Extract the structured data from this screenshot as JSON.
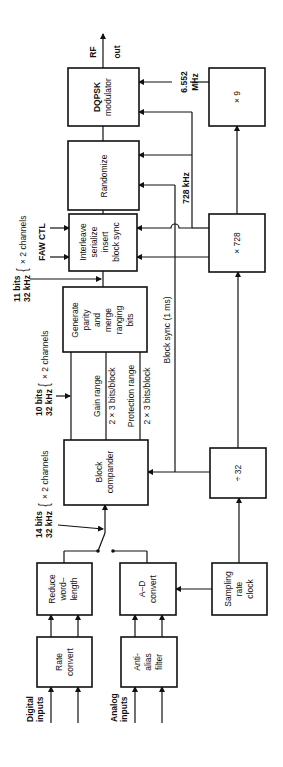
{
  "diagram": {
    "title": "",
    "orientation": "rotated-90-ccw",
    "blocks": [
      {
        "id": "dqpsk",
        "lines": [
          "DQPSK",
          "modulator"
        ]
      },
      {
        "id": "randomize",
        "lines": [
          "Randomize"
        ]
      },
      {
        "id": "interleave",
        "lines": [
          "Interleave",
          "serialize",
          "insert",
          "block sync"
        ]
      },
      {
        "id": "parity",
        "lines": [
          "Generate",
          "parity",
          "and",
          "merge",
          "ranging",
          "bits"
        ]
      },
      {
        "id": "compander",
        "lines": [
          "Block",
          "compander"
        ]
      },
      {
        "id": "x9",
        "lines": [
          "× 9"
        ]
      },
      {
        "id": "x728",
        "lines": [
          "× 728"
        ]
      },
      {
        "id": "div32",
        "lines": [
          "÷ 32"
        ]
      },
      {
        "id": "reduce",
        "lines": [
          "Reduce",
          "word–",
          "length"
        ]
      },
      {
        "id": "adconv",
        "lines": [
          "A–D",
          "convert"
        ]
      },
      {
        "id": "sampling",
        "lines": [
          "Sampling",
          "rate",
          "clock"
        ]
      },
      {
        "id": "rate",
        "lines": [
          "Rate",
          "convert"
        ]
      },
      {
        "id": "antialias",
        "lines": [
          "Anti-",
          "alias",
          "filter"
        ]
      }
    ],
    "labels": {
      "rf_out_1": "RF",
      "rf_out_2": "out",
      "mhz_1": "6.552",
      "mhz_2": "MHz",
      "khz728": "728 kHz",
      "bits11_1": "11 bits",
      "bits11_2": "32 kHz",
      "bits11_ch": "× 2 channels",
      "faw_ctl": "FAW  CTL",
      "bits10_1": "10 bits",
      "bits10_2": "32 kHz",
      "bits10_ch": "× 2 channels",
      "gain_range": "Gain range",
      "gain_bits": "2 × 3 bits/block",
      "prot_range": "Protection range",
      "prot_bits": "2 × 3 bits/block",
      "block_sync": "Block sync (1 ms)",
      "bits14_1": "14 bits",
      "bits14_2": "32 kHz",
      "bits14_ch": "× 2 channels",
      "digital_1": "Digital",
      "digital_2": "inputs",
      "analog_1": "Analog",
      "analog_2": "inputs",
      "brace": "{"
    }
  }
}
